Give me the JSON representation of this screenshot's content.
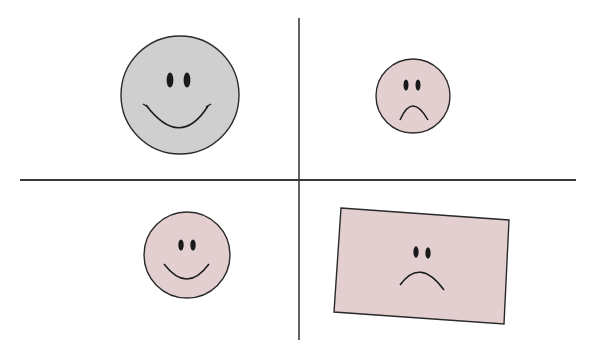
{
  "diagram": {
    "title": "",
    "layout": "2x2 quadrant grid divided by crossing axes",
    "colors": {
      "background": "#ffffff",
      "axis": "#3a3a3a",
      "outline": "#2a2a2a",
      "gray_fill": "#cfcfcf",
      "pink_fill": "#e3cfd0",
      "feature": "#1a1a1a"
    },
    "quadrants": [
      {
        "position": "top-left",
        "shape": "circle",
        "expression": "smile",
        "fill": "gray",
        "size": "large"
      },
      {
        "position": "top-right",
        "shape": "circle",
        "expression": "frown",
        "fill": "pink",
        "size": "small"
      },
      {
        "position": "bottom-left",
        "shape": "circle",
        "expression": "smile",
        "fill": "pink",
        "size": "small"
      },
      {
        "position": "bottom-right",
        "shape": "rectangle",
        "expression": "frown",
        "fill": "pink",
        "size": "large",
        "rotation_deg": 4
      }
    ]
  }
}
